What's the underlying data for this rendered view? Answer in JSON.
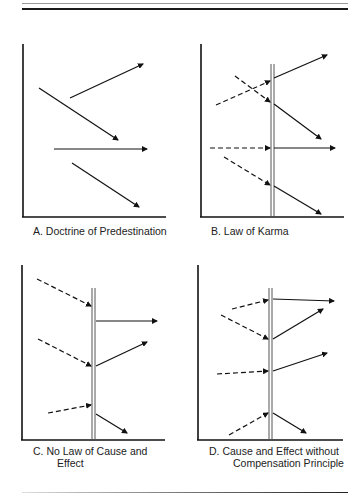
{
  "figure": {
    "panels": [
      {
        "id": "A",
        "caption_line1": "A.  Doctrine of Predestination",
        "caption_line2": ""
      },
      {
        "id": "B",
        "caption_line1": "B.  Law of Karma",
        "caption_line2": ""
      },
      {
        "id": "C",
        "caption_line1": "C.  No Law of Cause and",
        "caption_line2": "Effect"
      },
      {
        "id": "D",
        "caption_line1": "D.  Cause and Effect without",
        "caption_line2": "Compensation Principle"
      }
    ],
    "legend_semantics": {
      "solid_arrow": "effect / outcome",
      "dashed_arrow": "cause / prior action",
      "double_vertical_line": "present moment / barrier"
    }
  }
}
